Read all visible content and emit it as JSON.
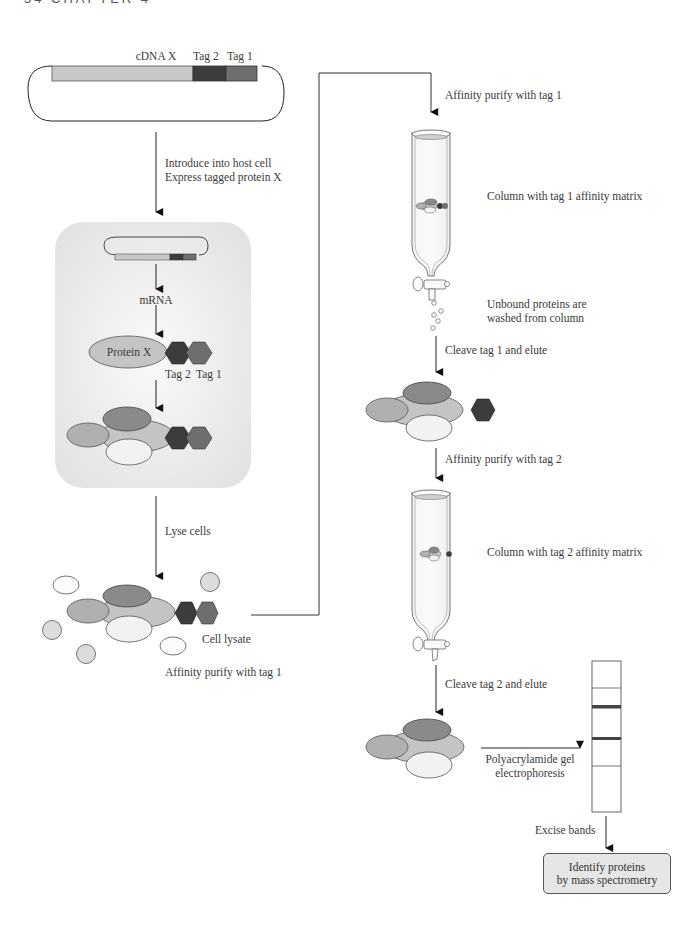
{
  "page_header": "34    CHAPTER 4",
  "plasmid": {
    "cdna_label": "cDNA X",
    "tag2_label": "Tag 2",
    "tag1_label": "Tag 1"
  },
  "steps": {
    "introduce_line1": "Introduce into host cell",
    "introduce_line2": "Express tagged protein X",
    "mrna": "mRNA",
    "protein_x": "Protein X",
    "tag2": "Tag 2",
    "tag1": "Tag 1",
    "lyse_cells": "Lyse cells",
    "cell_lysate": "Cell lysate",
    "affinity_purify_tag1_left": "Affinity purify with tag 1",
    "affinity_purify_tag1_right": "Affinity purify with tag 1",
    "column_tag1": "Column with tag 1 affinity matrix",
    "unbound_line1": "Unbound proteins are",
    "unbound_line2": "washed from column",
    "cleave_tag1": "Cleave tag 1 and elute",
    "affinity_purify_tag2": "Affinity purify with tag 2",
    "column_tag2": "Column with tag 2 affinity matrix",
    "cleave_tag2": "Cleave tag 2 and elute",
    "page_line1": "Polyacrylamide gel",
    "page_line2": "electrophoresis",
    "excise_bands": "Excise bands",
    "identify_line1": "Identify proteins",
    "identify_line2": "by mass spectrometry"
  },
  "colors": {
    "cdna": "#c8c8c8",
    "tag2": "#3c3c3c",
    "tag1": "#6e6e6e",
    "protein_main": "#c4c4c4",
    "partner_dark": "#8a8a8a",
    "partner_mid": "#b0b0b0",
    "partner_light": "#f2f2f2",
    "cell_bg": "#eeeeee",
    "ms_box": "#e6e6e6"
  }
}
